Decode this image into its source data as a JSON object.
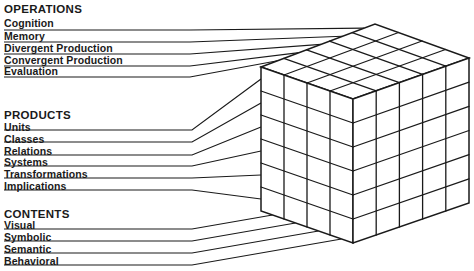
{
  "operations": {
    "header": "OPERATIONS",
    "items": [
      "Cognition",
      "Memory",
      "Divergent Production",
      "Convergent Production",
      "Evaluation"
    ]
  },
  "products": {
    "header": "PRODUCTS",
    "items": [
      "Units",
      "Classes",
      "Relations",
      "Systems",
      "Transformations",
      "Implications"
    ]
  },
  "contents": {
    "header": "CONTENTS",
    "items": [
      "Visual",
      "Symbolic",
      "Semantic",
      "Behavioral"
    ]
  },
  "cube": {
    "operations_divisions": 5,
    "products_divisions": 6,
    "contents_divisions": 4,
    "stroke_color": "#1a1a1a",
    "fill_color": "#ffffff"
  }
}
